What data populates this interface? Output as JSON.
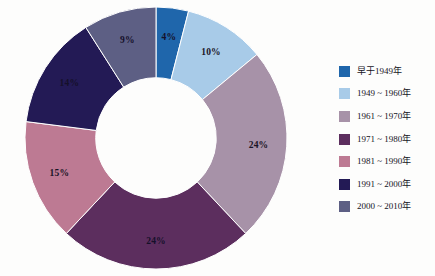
{
  "chart_data": {
    "type": "pie",
    "variant": "donut",
    "title": "",
    "subtitle": "",
    "xlabel": "",
    "ylabel": "",
    "grid": false,
    "legend_position": "right",
    "start_angle_deg": 0,
    "direction": "clockwise",
    "inner_radius_ratio": 0.46,
    "unit": "%",
    "categories": [
      "早于1949年",
      "1949 ~ 1960年",
      "1961 ~ 1970年",
      "1971 ~ 1980年",
      "1981 ~ 1990年",
      "1991 ~ 2000年",
      "2000 ~ 2010年"
    ],
    "values": [
      4,
      10,
      24,
      24,
      15,
      14,
      9
    ],
    "data_labels": [
      "4%",
      "10%",
      "24%",
      "24%",
      "15%",
      "14%",
      "9%"
    ],
    "colors": [
      "#1f66ab",
      "#a8cbe8",
      "#a792a8",
      "#5c2e5e",
      "#bd7a93",
      "#231a55",
      "#5d5f84"
    ],
    "slices": [
      {
        "label": "早于1949年",
        "value": 4,
        "data_label": "4%",
        "color": "#1f66ab",
        "label_on_dark": true
      },
      {
        "label": "1949 ~ 1960年",
        "value": 10,
        "data_label": "10%",
        "color": "#a8cbe8",
        "label_on_dark": false
      },
      {
        "label": "1961 ~ 1970年",
        "value": 24,
        "data_label": "24%",
        "color": "#a792a8",
        "label_on_dark": false
      },
      {
        "label": "1971 ~ 1980年",
        "value": 24,
        "data_label": "24%",
        "color": "#5c2e5e",
        "label_on_dark": true
      },
      {
        "label": "1981 ~ 1990年",
        "value": 15,
        "data_label": "15%",
        "color": "#bd7a93",
        "label_on_dark": false
      },
      {
        "label": "1991 ~ 2000年",
        "value": 14,
        "data_label": "14%",
        "color": "#231a55",
        "label_on_dark": true
      },
      {
        "label": "2000 ~ 2010年",
        "value": 9,
        "data_label": "9%",
        "color": "#5d5f84",
        "label_on_dark": true
      }
    ]
  },
  "legend": {
    "items": [
      {
        "label": "早于1949年",
        "color": "#1f66ab"
      },
      {
        "label": "1949 ~ 1960年",
        "color": "#a8cbe8"
      },
      {
        "label": "1961 ~ 1970年",
        "color": "#a792a8"
      },
      {
        "label": "1971 ~ 1980年",
        "color": "#5c2e5e"
      },
      {
        "label": "1981 ~ 1990年",
        "color": "#bd7a93"
      },
      {
        "label": "1991 ~ 2000年",
        "color": "#231a55"
      },
      {
        "label": "2000 ~ 2010年",
        "color": "#5d5f84"
      }
    ]
  },
  "canvas": {
    "background": "#fdfdfc",
    "hole_fill": "#ffffff"
  }
}
